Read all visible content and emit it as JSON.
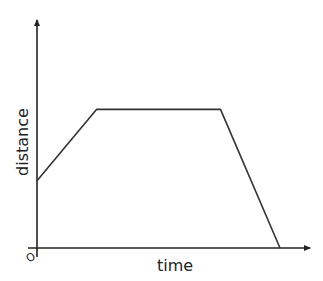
{
  "diagram": {
    "title": "",
    "x_axis_label": "time",
    "y_axis_label": "distance",
    "origin_label": "O",
    "graph_points": [
      {
        "t": 0,
        "d": 0.32
      },
      {
        "t": 0.24,
        "d": 0.66
      },
      {
        "t": 0.74,
        "d": 0.66
      },
      {
        "t": 0.98,
        "d": 0
      }
    ],
    "line_color": "#333333",
    "axis_color": "#222222"
  }
}
